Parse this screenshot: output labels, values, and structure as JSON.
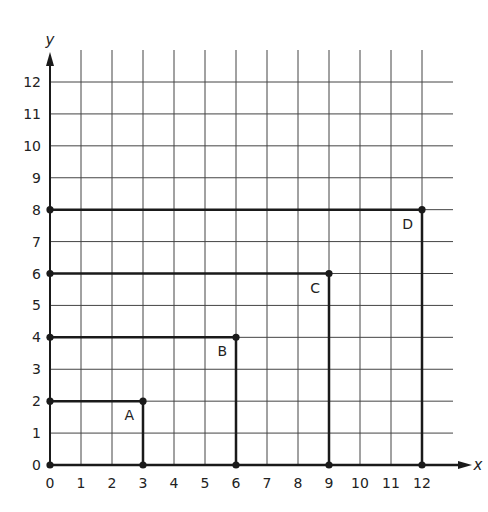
{
  "chart_data": {
    "type": "scatter",
    "title": "",
    "xlabel": "x",
    "ylabel": "y",
    "xlim": [
      0,
      12
    ],
    "ylim": [
      0,
      12
    ],
    "grid": true,
    "x_ticks": [
      "0",
      "1",
      "2",
      "3",
      "4",
      "5",
      "6",
      "7",
      "8",
      "9",
      "10",
      "11",
      "12"
    ],
    "y_ticks": [
      "0",
      "1",
      "2",
      "3",
      "4",
      "5",
      "6",
      "7",
      "8",
      "9",
      "10",
      "11",
      "12"
    ],
    "rectangles": [
      {
        "label": "A",
        "x0": 0,
        "y0": 0,
        "width": 3,
        "height": 2,
        "corner": [
          3,
          2
        ]
      },
      {
        "label": "B",
        "x0": 0,
        "y0": 0,
        "width": 6,
        "height": 4,
        "corner": [
          6,
          4
        ]
      },
      {
        "label": "C",
        "x0": 0,
        "y0": 0,
        "width": 9,
        "height": 6,
        "corner": [
          9,
          6
        ]
      },
      {
        "label": "D",
        "x0": 0,
        "y0": 0,
        "width": 12,
        "height": 8,
        "corner": [
          12,
          8
        ]
      }
    ],
    "points": [
      {
        "x": 0,
        "y": 0
      },
      {
        "x": 3,
        "y": 0
      },
      {
        "x": 6,
        "y": 0
      },
      {
        "x": 9,
        "y": 0
      },
      {
        "x": 12,
        "y": 0
      },
      {
        "x": 0,
        "y": 2
      },
      {
        "x": 0,
        "y": 4
      },
      {
        "x": 0,
        "y": 6
      },
      {
        "x": 0,
        "y": 8
      },
      {
        "x": 3,
        "y": 2
      },
      {
        "x": 6,
        "y": 4
      },
      {
        "x": 9,
        "y": 6
      },
      {
        "x": 12,
        "y": 8
      }
    ],
    "colors": {
      "grid": "#444444",
      "shape": "#1a1a1a"
    }
  }
}
